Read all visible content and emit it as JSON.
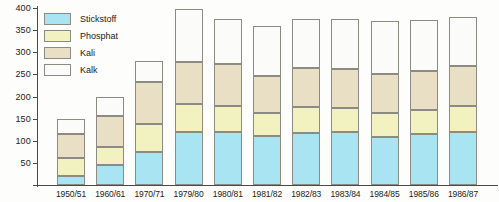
{
  "chart_data": {
    "type": "bar",
    "stacked": true,
    "title": "",
    "xlabel": "",
    "ylabel": "",
    "ylim": [
      0,
      400
    ],
    "ytick_values": [
      0,
      50,
      100,
      150,
      200,
      250,
      300,
      350,
      400
    ],
    "ytick_labels": [
      "",
      "50",
      "100",
      "150",
      "200",
      "250",
      "300",
      "350",
      "400"
    ],
    "grid": false,
    "legend_position": "upper-left",
    "categories": [
      "1950/51",
      "1960/61",
      "1970/71",
      "1979/80",
      "1980/81",
      "1981/82",
      "1982/83",
      "1983/84",
      "1984/85",
      "1985/86",
      "1986/87"
    ],
    "series": [
      {
        "name": "Stickstoff",
        "color": "#a8e4f2",
        "values": [
          20,
          45,
          75,
          120,
          120,
          110,
          118,
          120,
          108,
          115,
          120
        ]
      },
      {
        "name": "Phosphat",
        "color": "#f2f1c0",
        "values": [
          40,
          40,
          62,
          62,
          58,
          52,
          58,
          55,
          55,
          55,
          58
        ]
      },
      {
        "name": "Kali",
        "color": "#e8dfc4",
        "values": [
          55,
          70,
          95,
          95,
          95,
          85,
          88,
          88,
          88,
          88,
          92
        ]
      },
      {
        "name": "Kalk",
        "color": "#fbfbfa",
        "values": [
          35,
          45,
          48,
          120,
          102,
          113,
          111,
          112,
          120,
          115,
          110
        ]
      }
    ],
    "totals": [
      150,
      200,
      280,
      397,
      375,
      360,
      375,
      375,
      371,
      373,
      380
    ]
  },
  "legend": {
    "items": [
      {
        "label": "Stickstoff",
        "color": "#a8e4f2"
      },
      {
        "label": "Phosphat",
        "color": "#f2f1c0"
      },
      {
        "label": "Kali",
        "color": "#e8dfc4"
      },
      {
        "label": "Kalk",
        "color": "#fbfbfa"
      }
    ]
  }
}
